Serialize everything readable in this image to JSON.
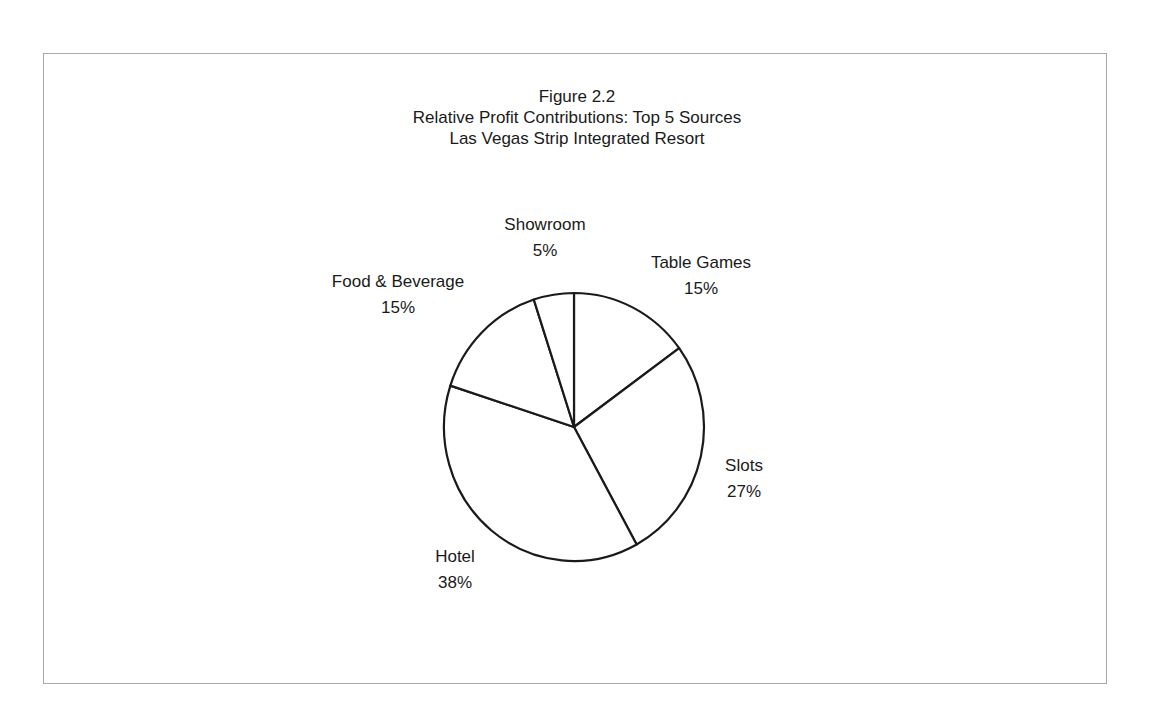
{
  "chart_data": {
    "type": "pie",
    "title": "Figure 2.2",
    "subtitle": [
      "Relative Profit Contributions: Top 5 Sources",
      "Las Vegas Strip Integrated Resort"
    ],
    "categories": [
      "Table Games",
      "Slots",
      "Hotel",
      "Food & Beverage",
      "Showroom"
    ],
    "values": [
      15,
      27,
      38,
      15,
      5
    ],
    "labels": [
      "15%",
      "27%",
      "38%",
      "15%",
      "5%"
    ],
    "unit": "%",
    "start_angle": "12 o'clock, clockwise",
    "fill": "#ffffff",
    "stroke": "#1a1a1a",
    "legend": "none (data labels beside slices)"
  },
  "figure": {
    "number": "Figure 2.2",
    "line1": "Relative Profit Contributions: Top 5 Sources",
    "line2": "Las Vegas Strip Integrated Resort"
  },
  "slices": [
    {
      "name": "Table Games",
      "pct": "15%"
    },
    {
      "name": "Slots",
      "pct": "27%"
    },
    {
      "name": "Hotel",
      "pct": "38%"
    },
    {
      "name": "Food & Beverage",
      "pct": "15%"
    },
    {
      "name": "Showroom",
      "pct": "5%"
    }
  ]
}
